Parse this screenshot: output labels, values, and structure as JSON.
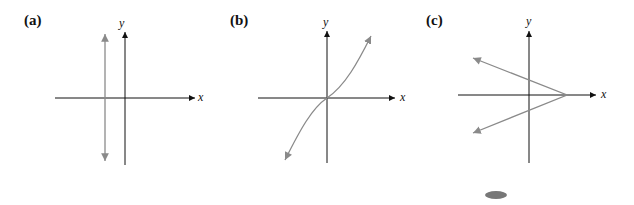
{
  "panels": [
    {
      "label": "(a)",
      "x_axis": "x",
      "y_axis": "y",
      "description": "vertical line (not a function)"
    },
    {
      "label": "(b)",
      "x_axis": "x",
      "y_axis": "y",
      "description": "increasing curve through origin"
    },
    {
      "label": "(c)",
      "x_axis": "x",
      "y_axis": "y",
      "description": "sideways V opening left (not a function)"
    }
  ],
  "colors": {
    "axis": "#111111",
    "curve": "#8a8a8a"
  }
}
